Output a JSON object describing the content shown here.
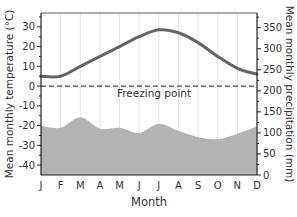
{
  "chart_data": {
    "type": "line+area",
    "title": "",
    "xlabel": "Month",
    "ylabel_left": "Mean monthly temperature (°C)",
    "ylabel_right": "Mean monthly precipitation (mm)",
    "categories": [
      "J",
      "F",
      "M",
      "A",
      "M",
      "J",
      "J",
      "A",
      "S",
      "O",
      "N",
      "D"
    ],
    "series": [
      {
        "name": "Temperature",
        "axis": "left",
        "type": "line",
        "color": "#666666",
        "values": [
          5,
          5,
          10,
          15,
          20,
          25,
          28.5,
          27,
          22,
          15,
          9,
          6
        ]
      },
      {
        "name": "Precipitation",
        "axis": "right",
        "type": "area",
        "color": "#b3b3b3",
        "values": [
          117,
          112,
          137,
          110,
          112,
          100,
          122,
          105,
          90,
          85,
          98,
          115
        ]
      }
    ],
    "ylim_left": [
      -45,
      37
    ],
    "yticks_left": [
      -40,
      -30,
      -20,
      -10,
      0,
      10,
      20,
      30
    ],
    "ylim_right": [
      0,
      385
    ],
    "yticks_right": [
      0,
      50,
      100,
      150,
      200,
      250,
      300,
      350
    ],
    "annotations": [
      {
        "text": "Freezing point",
        "y": 0,
        "axis": "left",
        "style": "dashed"
      }
    ],
    "grid": "vertical",
    "legend": "none"
  }
}
